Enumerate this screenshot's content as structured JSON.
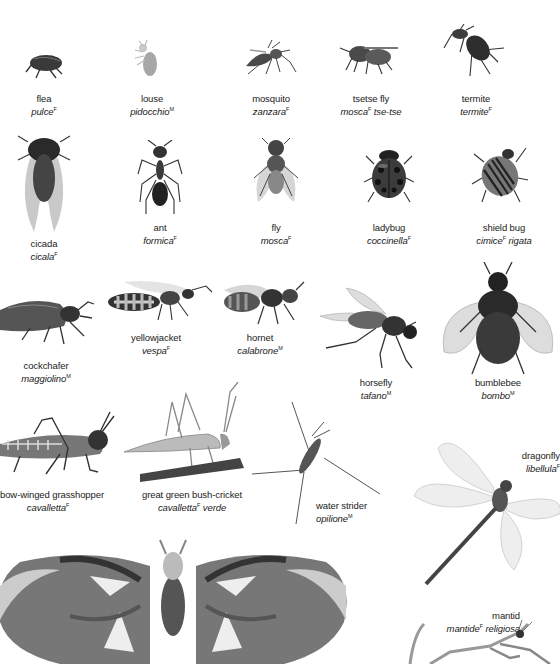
{
  "page": {
    "topic": "insects",
    "entries": [
      {
        "id": "flea",
        "en": "flea",
        "it": "pulce",
        "gender": "F",
        "it_suffix": ""
      },
      {
        "id": "louse",
        "en": "louse",
        "it": "pidocchio",
        "gender": "M",
        "it_suffix": ""
      },
      {
        "id": "mosquito",
        "en": "mosquito",
        "it": "zanzara",
        "gender": "F",
        "it_suffix": ""
      },
      {
        "id": "tsetse-fly",
        "en": "tsetse fly",
        "it": "mosca",
        "gender": "F",
        "it_suffix": "tse-tse"
      },
      {
        "id": "termite",
        "en": "termite",
        "it": "termite",
        "gender": "F",
        "it_suffix": ""
      },
      {
        "id": "cicada",
        "en": "cicada",
        "it": "cicala",
        "gender": "F",
        "it_suffix": ""
      },
      {
        "id": "ant",
        "en": "ant",
        "it": "formica",
        "gender": "F",
        "it_suffix": ""
      },
      {
        "id": "fly",
        "en": "fly",
        "it": "mosca",
        "gender": "F",
        "it_suffix": ""
      },
      {
        "id": "ladybug",
        "en": "ladybug",
        "it": "coccinella",
        "gender": "F",
        "it_suffix": ""
      },
      {
        "id": "shield-bug",
        "en": "shield bug",
        "it": "cimice",
        "gender": "F",
        "it_suffix": "rigata"
      },
      {
        "id": "cockchafer",
        "en": "cockchafer",
        "it": "maggiolino",
        "gender": "M",
        "it_suffix": ""
      },
      {
        "id": "yellowjacket",
        "en": "yellowjacket",
        "it": "vespa",
        "gender": "F",
        "it_suffix": ""
      },
      {
        "id": "hornet",
        "en": "hornet",
        "it": "calabrone",
        "gender": "M",
        "it_suffix": ""
      },
      {
        "id": "horsefly",
        "en": "horsefly",
        "it": "tafano",
        "gender": "M",
        "it_suffix": ""
      },
      {
        "id": "bumblebee",
        "en": "bumblebee",
        "it": "bombo",
        "gender": "M",
        "it_suffix": ""
      },
      {
        "id": "bow-winged-grasshopper",
        "en": "bow-winged grasshopper",
        "it": "cavalletta",
        "gender": "F",
        "it_suffix": ""
      },
      {
        "id": "great-green-bush-cricket",
        "en": "great green bush-cricket",
        "it": "cavalletta",
        "gender": "F",
        "it_suffix": "verde"
      },
      {
        "id": "water-strider",
        "en": "water strider",
        "it": "opilione",
        "gender": "M",
        "it_suffix": ""
      },
      {
        "id": "dragonfly",
        "en": "dragonfly",
        "it": "libellula",
        "gender": "F",
        "it_suffix": ""
      },
      {
        "id": "mantid",
        "en": "mantid",
        "it": "mantide",
        "gender": "F",
        "it_suffix": "religiosa"
      },
      {
        "id": "atlas-moth",
        "en": "",
        "it": "",
        "gender": "",
        "it_suffix": ""
      }
    ]
  }
}
